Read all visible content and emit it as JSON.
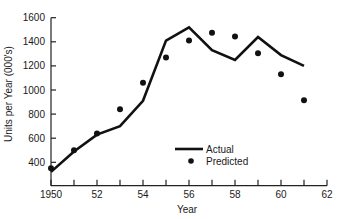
{
  "chart_data": {
    "type": "line",
    "title": "",
    "xlabel": "Year",
    "ylabel": "Units per Year (000's)",
    "x": [
      1950,
      1951,
      1952,
      1953,
      1954,
      1955,
      1956,
      1957,
      1958,
      1959,
      1960,
      1961
    ],
    "series": [
      {
        "name": "Actual",
        "style": "line",
        "values": [
          320,
          490,
          630,
          700,
          910,
          1410,
          1520,
          1330,
          1250,
          1440,
          1290,
          1200
        ]
      },
      {
        "name": "Predicted",
        "style": "scatter",
        "values": [
          350,
          500,
          640,
          840,
          1060,
          1270,
          1410,
          1475,
          1445,
          1305,
          1130,
          915
        ]
      }
    ],
    "x_ticks": [
      1950,
      1951,
      1952,
      1953,
      1954,
      1955,
      1956,
      1957,
      1958,
      1959,
      1960,
      1961,
      1962
    ],
    "x_tick_labels": [
      {
        "value": 1950,
        "label": "1950"
      },
      {
        "value": 1952,
        "label": "52"
      },
      {
        "value": 1954,
        "label": "54"
      },
      {
        "value": 1956,
        "label": "56"
      },
      {
        "value": 1958,
        "label": "58"
      },
      {
        "value": 1960,
        "label": "60"
      },
      {
        "value": 1962,
        "label": "62"
      }
    ],
    "y_ticks": [
      400,
      600,
      800,
      1000,
      1200,
      1400,
      1600
    ],
    "y_tick_labels": [
      "400",
      "600",
      "800",
      "1000",
      "1200",
      "1400",
      "1600"
    ],
    "xlim": [
      1950,
      1962
    ],
    "ylim": [
      206,
      1600
    ],
    "grid": false,
    "legend": {
      "position": "lower right",
      "entries": [
        {
          "label": "Actual",
          "marker": "line"
        },
        {
          "label": "Predicted",
          "marker": "dot"
        }
      ]
    },
    "colors": {
      "line": "#111111",
      "dot": "#111111",
      "axis": "#222222"
    }
  }
}
